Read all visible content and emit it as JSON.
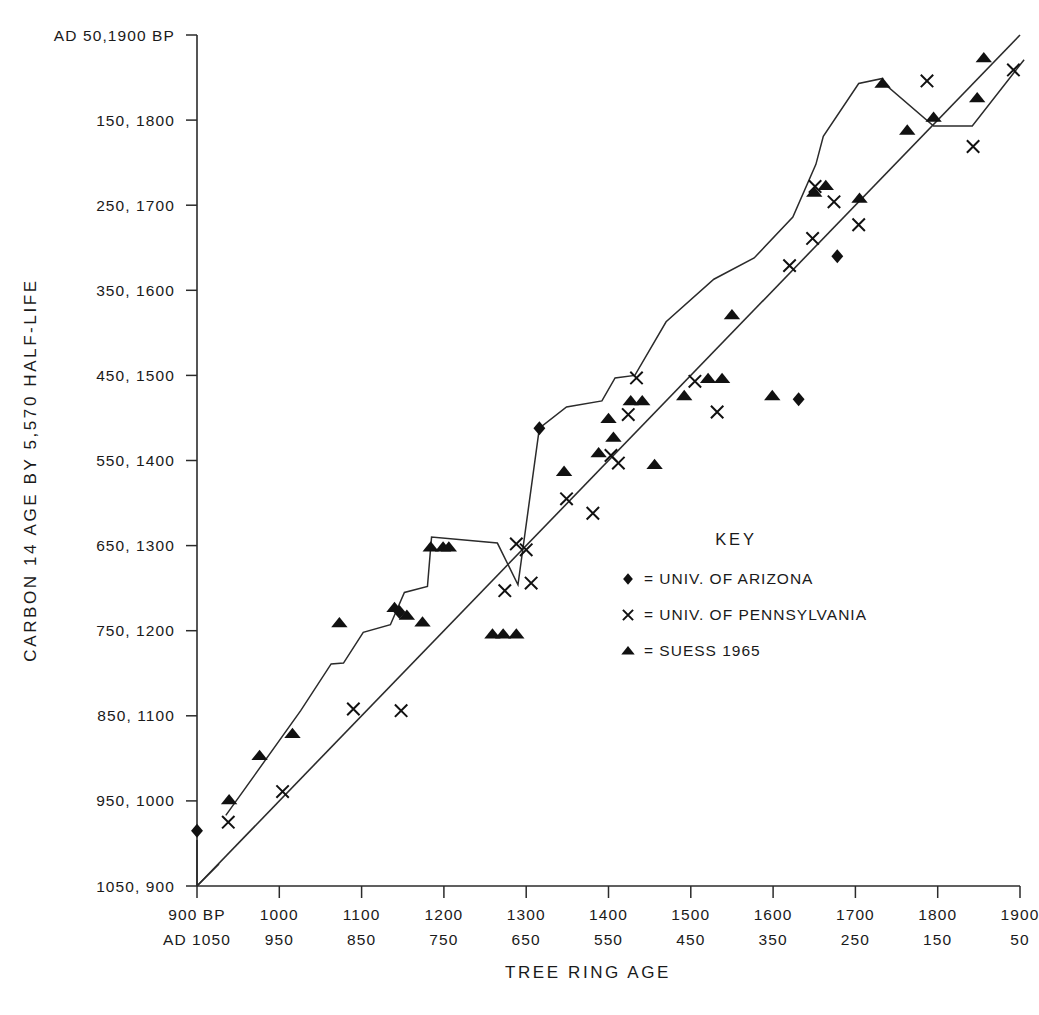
{
  "chart_data": {
    "type": "scatter",
    "title": "",
    "xlabel": "TREE RING AGE",
    "ylabel": "CARBON 14 AGE BY 5,570 HALF-LIFE",
    "xlim": [
      900,
      1900
    ],
    "ylim": [
      900,
      1900
    ],
    "grid": false,
    "legend_position": "inside-right",
    "x_axis": {
      "label": "TREE RING AGE",
      "primary_unit": "BP",
      "secondary_unit": "AD",
      "ticks": [
        {
          "value": 900,
          "bp": "900 BP",
          "ad": "AD 1050"
        },
        {
          "value": 1000,
          "bp": "1000",
          "ad": "950"
        },
        {
          "value": 1100,
          "bp": "1100",
          "ad": "850"
        },
        {
          "value": 1200,
          "bp": "1200",
          "ad": "750"
        },
        {
          "value": 1300,
          "bp": "1300",
          "ad": "650"
        },
        {
          "value": 1400,
          "bp": "1400",
          "ad": "550"
        },
        {
          "value": 1500,
          "bp": "1500",
          "ad": "450"
        },
        {
          "value": 1600,
          "bp": "1600",
          "ad": "350"
        },
        {
          "value": 1700,
          "bp": "1700",
          "ad": "250"
        },
        {
          "value": 1800,
          "bp": "1800",
          "ad": "150"
        },
        {
          "value": 1900,
          "bp": "1900",
          "ad": "50"
        }
      ]
    },
    "y_axis": {
      "label": "CARBON 14 AGE BY 5,570 HALF-LIFE",
      "ticks": [
        {
          "value": 1900,
          "label": "AD 50,1900 BP"
        },
        {
          "value": 1800,
          "label": "150, 1800"
        },
        {
          "value": 1700,
          "label": "250, 1700"
        },
        {
          "value": 1600,
          "label": "350, 1600"
        },
        {
          "value": 1500,
          "label": "450, 1500"
        },
        {
          "value": 1400,
          "label": "550, 1400"
        },
        {
          "value": 1300,
          "label": "650, 1300"
        },
        {
          "value": 1200,
          "label": "750, 1200"
        },
        {
          "value": 1100,
          "label": "850, 1100"
        },
        {
          "value": 1000,
          "label": "950, 1000"
        },
        {
          "value": 900,
          "label": "1050, 900"
        }
      ]
    },
    "series": [
      {
        "name": "UNIV. OF ARIZONA",
        "marker": "diamond",
        "points": [
          [
            900,
            965
          ],
          [
            1146,
            1222
          ],
          [
            1316,
            1438
          ],
          [
            1631,
            1472
          ],
          [
            1678,
            1640
          ]
        ]
      },
      {
        "name": "UNIV. OF PENNSYLVANIA",
        "marker": "x",
        "points": [
          [
            938,
            975
          ],
          [
            1004,
            1011
          ],
          [
            1090,
            1108
          ],
          [
            1148,
            1106
          ],
          [
            1274,
            1247
          ],
          [
            1288,
            1302
          ],
          [
            1300,
            1295
          ],
          [
            1306,
            1256
          ],
          [
            1349,
            1355
          ],
          [
            1381,
            1338
          ],
          [
            1403,
            1406
          ],
          [
            1412,
            1397
          ],
          [
            1424,
            1454
          ],
          [
            1434,
            1497
          ],
          [
            1505,
            1493
          ],
          [
            1532,
            1457
          ],
          [
            1620,
            1629
          ],
          [
            1648,
            1661
          ],
          [
            1651,
            1722
          ],
          [
            1674,
            1704
          ],
          [
            1704,
            1677
          ],
          [
            1787,
            1846
          ],
          [
            1843,
            1769
          ],
          [
            1892,
            1859
          ]
        ]
      },
      {
        "name": "SUESS 1965",
        "marker": "triangle",
        "points": [
          [
            939,
            1001
          ],
          [
            976,
            1053
          ],
          [
            1016,
            1079
          ],
          [
            1073,
            1209
          ],
          [
            1140,
            1227
          ],
          [
            1155,
            1218
          ],
          [
            1174,
            1210
          ],
          [
            1184,
            1298
          ],
          [
            1199,
            1298
          ],
          [
            1206,
            1298
          ],
          [
            1259,
            1196
          ],
          [
            1272,
            1196
          ],
          [
            1288,
            1196
          ],
          [
            1346,
            1387
          ],
          [
            1388,
            1409
          ],
          [
            1400,
            1449
          ],
          [
            1406,
            1427
          ],
          [
            1427,
            1470
          ],
          [
            1441,
            1470
          ],
          [
            1456,
            1395
          ],
          [
            1492,
            1476
          ],
          [
            1521,
            1496
          ],
          [
            1538,
            1496
          ],
          [
            1550,
            1571
          ],
          [
            1599,
            1476
          ],
          [
            1650,
            1715
          ],
          [
            1664,
            1723
          ],
          [
            1705,
            1708
          ],
          [
            1733,
            1843
          ],
          [
            1763,
            1788
          ],
          [
            1795,
            1803
          ],
          [
            1848,
            1826
          ],
          [
            1856,
            1873
          ]
        ]
      }
    ],
    "reference_line": {
      "name": "one-to-one-line",
      "description": "straight diagonal line of equality",
      "from": [
        900,
        900
      ],
      "to": [
        1900,
        1900
      ]
    },
    "calibration_curve": {
      "name": "suess-calibration-curve",
      "description": "wiggly bristlecone pine calibration curve",
      "points": [
        [
          935,
          983
        ],
        [
          1026,
          1106
        ],
        [
          1063,
          1161
        ],
        [
          1078,
          1162
        ],
        [
          1102,
          1198
        ],
        [
          1135,
          1207
        ],
        [
          1152,
          1245
        ],
        [
          1180,
          1252
        ],
        [
          1185,
          1310
        ],
        [
          1265,
          1303
        ],
        [
          1290,
          1254
        ],
        [
          1316,
          1438
        ],
        [
          1349,
          1463
        ],
        [
          1392,
          1470
        ],
        [
          1408,
          1497
        ],
        [
          1432,
          1500
        ],
        [
          1470,
          1563
        ],
        [
          1528,
          1613
        ],
        [
          1577,
          1638
        ],
        [
          1624,
          1686
        ],
        [
          1652,
          1748
        ],
        [
          1661,
          1781
        ],
        [
          1704,
          1843
        ],
        [
          1733,
          1849
        ],
        [
          1735,
          1843
        ],
        [
          1795,
          1793
        ],
        [
          1842,
          1793
        ],
        [
          1905,
          1871
        ]
      ]
    },
    "legend": {
      "title": "KEY",
      "entries": [
        {
          "marker": "diamond",
          "text": "= UNIV. OF  ARIZONA"
        },
        {
          "marker": "x",
          "text": "= UNIV. OF  PENNSYLVANIA"
        },
        {
          "marker": "triangle",
          "text": "= SUESS  1965"
        }
      ]
    },
    "colors": {
      "ink": "#1a1a1a",
      "background": "#ffffff",
      "marker": "#111111"
    }
  }
}
